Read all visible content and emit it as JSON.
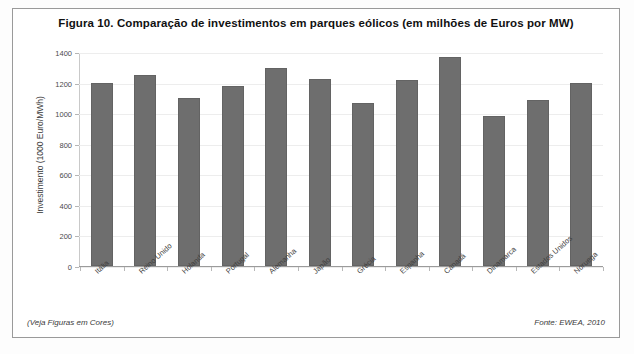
{
  "figure": {
    "title": "Figura 10. Comparação de investimentos em parques eólicos (em milhões de Euros por MW)",
    "footnote_left": "(Veja Figuras em Cores)",
    "footnote_right": "Fonte: EWEA, 2010",
    "bar_color": "#6e6e6e",
    "frame_color": "#9a9a9a",
    "grid_color": "#ededed"
  },
  "chart_data": {
    "type": "bar",
    "title": "Figura 10. Comparação de investimentos em parques eólicos (em milhões de Euros por MW)",
    "xlabel": "",
    "ylabel": "Investimento (1000 Euro/MWh)",
    "ylim": [
      0,
      1400
    ],
    "yticks": [
      0,
      200,
      400,
      600,
      800,
      1000,
      1200,
      1400
    ],
    "ytick_labels": [
      "0",
      "200",
      "400",
      "600",
      "800",
      "1000",
      "1200",
      "1400"
    ],
    "grid": true,
    "legend": false,
    "categories": [
      "Itália",
      "Reino Unido",
      "Holanda",
      "Portugal",
      "Alemanha",
      "Japão",
      "Grécia",
      "Espanha",
      "Canadá",
      "Dinamarca",
      "Estados Unidos",
      "Noruega"
    ],
    "values": [
      1200,
      1250,
      1100,
      1175,
      1295,
      1225,
      1065,
      1220,
      1370,
      980,
      1085,
      1200
    ]
  }
}
